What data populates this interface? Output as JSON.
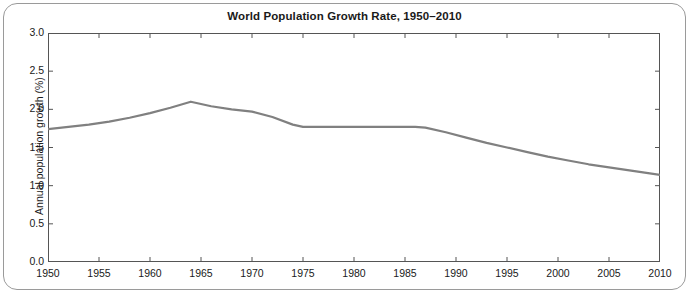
{
  "chart_data": {
    "type": "line",
    "title": "World Population Growth Rate, 1950–2010",
    "xlabel": "",
    "ylabel": "Annual population growth (%)",
    "xlim": [
      1950,
      2010
    ],
    "ylim": [
      0.0,
      3.0
    ],
    "xticks": [
      1950,
      1955,
      1960,
      1965,
      1970,
      1975,
      1980,
      1985,
      1990,
      1995,
      2000,
      2005,
      2010
    ],
    "xtick_labels": [
      "1950",
      "1955",
      "1960",
      "1965",
      "1970",
      "1975",
      "1980",
      "1985",
      "1990",
      "1995",
      "2000",
      "2005",
      "2010"
    ],
    "yticks": [
      0.0,
      0.5,
      1.0,
      1.5,
      2.0,
      2.5,
      3.0
    ],
    "ytick_labels": [
      "0.0",
      "0.5",
      "1.0",
      "1.5",
      "2.0",
      "2.5",
      "3.0"
    ],
    "grid": false,
    "legend": null,
    "line_color": "#808080",
    "line_width": 2.2,
    "x": [
      1950,
      1952,
      1954,
      1956,
      1958,
      1960,
      1962,
      1964,
      1966,
      1968,
      1970,
      1972,
      1974,
      1975,
      1977,
      1980,
      1983,
      1986,
      1987,
      1989,
      1991,
      1993,
      1995,
      1997,
      1999,
      2001,
      2003,
      2005,
      2007,
      2009,
      2010
    ],
    "values": [
      1.74,
      1.77,
      1.8,
      1.84,
      1.89,
      1.95,
      2.02,
      2.1,
      2.04,
      2.0,
      1.97,
      1.9,
      1.8,
      1.77,
      1.77,
      1.77,
      1.77,
      1.77,
      1.76,
      1.7,
      1.63,
      1.56,
      1.5,
      1.44,
      1.38,
      1.33,
      1.28,
      1.24,
      1.2,
      1.16,
      1.14
    ]
  },
  "axes": {
    "title": "World Population Growth Rate, 1950–2010",
    "ylabel": "Annual population growth (%)"
  }
}
